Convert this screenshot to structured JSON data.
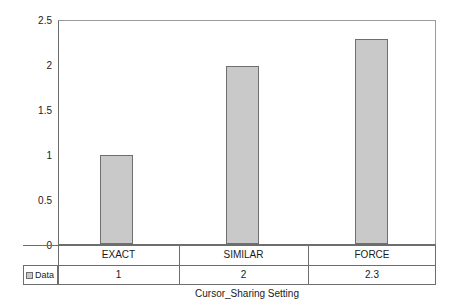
{
  "chart_data": {
    "type": "bar",
    "title": "",
    "xlabel": "Cursor_Sharing Setting",
    "ylabel": "Normalized Throughput",
    "categories": [
      "EXACT",
      "SIMILAR",
      "FORCE"
    ],
    "values": [
      1,
      2,
      2.3
    ],
    "value_labels": [
      "1",
      "2",
      "2.3"
    ],
    "series": [
      {
        "name": "Data",
        "values": [
          1,
          2,
          2.3
        ]
      }
    ],
    "ylim": [
      0,
      2.5
    ],
    "ytick_labels": [
      "0",
      "0.5",
      "1",
      "1.5",
      "2",
      "2.5"
    ],
    "ytick_values": [
      0,
      0.5,
      1,
      1.5,
      2,
      2.5
    ],
    "grid": false,
    "legend_position": "data-table-left",
    "bar_fill_color": "#c9c9c9",
    "bar_border_color": "#6f6f6f",
    "axis_color": "#6d6d6d",
    "background_color": "#ffffff"
  },
  "legend": {
    "label": "Data",
    "swatch_color": "#c9c9c9"
  },
  "table": {
    "category_row": [
      "EXACT",
      "SIMILAR",
      "FORCE"
    ],
    "value_row": [
      "1",
      "2",
      "2.3"
    ]
  }
}
